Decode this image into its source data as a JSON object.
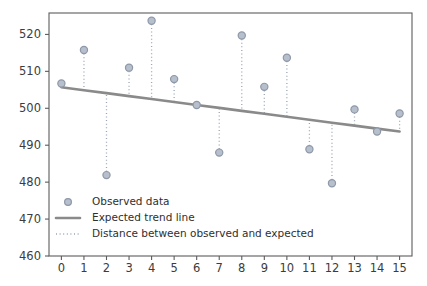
{
  "chart_data": {
    "type": "scatter",
    "title": "",
    "xlabel": "",
    "ylabel": "",
    "xlim": [
      -0.55,
      15.55
    ],
    "ylim": [
      460,
      525.8
    ],
    "grid": false,
    "legend_position": "lower left",
    "x": [
      0,
      1,
      2,
      3,
      4,
      5,
      6,
      7,
      8,
      9,
      10,
      11,
      12,
      13,
      14,
      15
    ],
    "xtick_labels": [
      "0",
      "1",
      "2",
      "3",
      "4",
      "5",
      "6",
      "7",
      "8",
      "9",
      "10",
      "11",
      "12",
      "13",
      "14",
      "15"
    ],
    "ytick_values": [
      460,
      470,
      480,
      490,
      500,
      510,
      520
    ],
    "ytick_labels": [
      "460",
      "470",
      "480",
      "490",
      "500",
      "510",
      "520"
    ],
    "series": [
      {
        "name": "Observed data",
        "kind": "scatter",
        "marker": "circle",
        "color": "#8d98a8",
        "values": [
          506.7,
          515.8,
          481.9,
          511.0,
          523.7,
          507.9,
          500.9,
          488.0,
          519.7,
          505.8,
          513.7,
          488.9,
          479.7,
          499.7,
          493.7,
          498.6
        ]
      },
      {
        "name": "Expected trend line",
        "kind": "line",
        "color": "#8a8a8a",
        "values": [
          505.7,
          504.9,
          504.1,
          503.3,
          502.5,
          501.7,
          500.9,
          500.1,
          499.3,
          498.5,
          497.7,
          496.9,
          496.1,
          495.3,
          494.5,
          493.7
        ]
      },
      {
        "name": "Distance between observed and expected",
        "kind": "dotted-residual",
        "color": "#9aa6b4",
        "values": [
          1.0,
          10.9,
          -22.2,
          7.7,
          21.2,
          6.2,
          0.0,
          -12.1,
          20.4,
          7.3,
          16.0,
          -8.0,
          -16.4,
          4.4,
          -0.8,
          4.9
        ]
      }
    ],
    "legend_entries": [
      {
        "label": "Observed data",
        "glyph": "circle-marker",
        "color": "#8d98a8"
      },
      {
        "label": "Expected trend line",
        "glyph": "solid-line",
        "color": "#8a8a8a"
      },
      {
        "label": "Distance between observed and expected",
        "glyph": "dotted-line",
        "color": "#9aa6b4"
      }
    ]
  }
}
